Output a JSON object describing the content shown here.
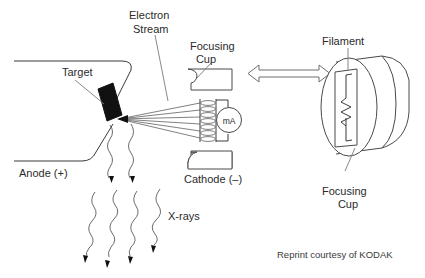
{
  "figure": {
    "background_color": "#ffffff",
    "ink_color": "#3a3a3a",
    "target_fill": "#111111"
  },
  "labels": {
    "electron_stream": "Electron\nStream",
    "electron_stream_line1": "Electron",
    "electron_stream_line2": "Stream",
    "target": "Target",
    "anode": "Anode (+)",
    "focusing_cup_top_line1": "Focusing",
    "focusing_cup_top_line2": "Cup",
    "cathode": "Cathode (–)",
    "filament": "Filament",
    "focusing_cup_bottom_line1": "Focusing",
    "focusing_cup_bottom_line2": "Cup",
    "xrays": "X-rays",
    "meter": "mA",
    "credit": "Reprint courtesy of KODAK"
  },
  "components": {
    "anode_assembly": "anode-with-target",
    "target_angle_degrees": 20,
    "electron_beam_count": 6,
    "filament_coil_turns": 7,
    "xray_arrow_count": 6,
    "double_arrow": "bidirectional-association-arrow"
  }
}
